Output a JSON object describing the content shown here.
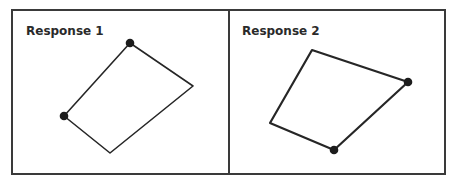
{
  "panels": [
    {
      "label": "Response 1",
      "shape": {
        "type": "quadrilateral",
        "vertices": [
          {
            "name": "top",
            "x": 130,
            "y": 43,
            "marked": true
          },
          {
            "name": "right",
            "x": 193,
            "y": 86,
            "marked": false
          },
          {
            "name": "bottom",
            "x": 110,
            "y": 153,
            "marked": false
          },
          {
            "name": "left",
            "x": 64,
            "y": 116,
            "marked": true
          }
        ],
        "stroke_width": 1.6
      }
    },
    {
      "label": "Response 2",
      "shape": {
        "type": "quadrilateral",
        "vertices": [
          {
            "name": "top-left",
            "x": 312,
            "y": 50,
            "marked": false
          },
          {
            "name": "right",
            "x": 408,
            "y": 82,
            "marked": true
          },
          {
            "name": "bottom",
            "x": 334,
            "y": 150,
            "marked": true
          },
          {
            "name": "left",
            "x": 270,
            "y": 123,
            "marked": false
          }
        ],
        "stroke_width": 2.2
      }
    }
  ],
  "colors": {
    "border": "#3a3a3a",
    "ink": "#262626",
    "dot": "#1c1c1c",
    "background": "#ffffff"
  }
}
